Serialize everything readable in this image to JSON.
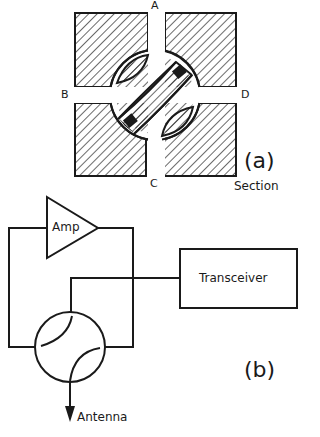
{
  "figure_a": {
    "label": "(a)",
    "caption": "Section",
    "ports": {
      "a": "A",
      "b": "B",
      "c": "C",
      "d": "D"
    }
  },
  "figure_b": {
    "label": "(b)",
    "amplifier": "Amp",
    "transceiver": "Transceiver",
    "antenna": "Antenna"
  },
  "colors": {
    "ink": "#1a1a1a",
    "background": "#ffffff"
  }
}
